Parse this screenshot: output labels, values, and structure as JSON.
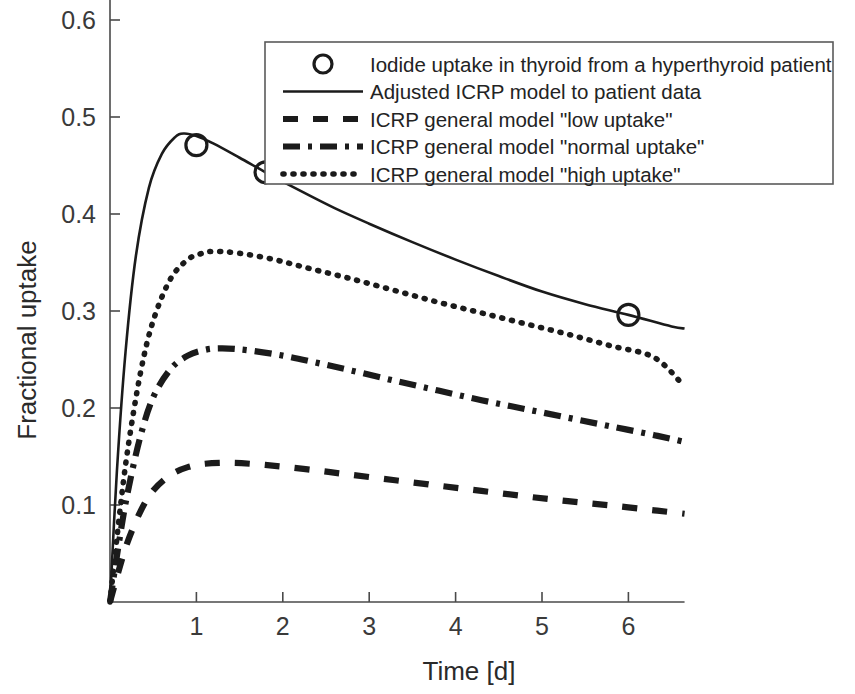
{
  "chart_data": {
    "type": "line",
    "title": "",
    "xlabel": "Time [d]",
    "ylabel": "Fractional uptake",
    "xlim": [
      0,
      6.65
    ],
    "ylim": [
      0,
      0.665
    ],
    "xticks": [
      1,
      2,
      3,
      4,
      5,
      6
    ],
    "xtick_labels": [
      "1",
      "2",
      "3",
      "4",
      "5",
      "6"
    ],
    "yticks": [
      0.1,
      0.2,
      0.3,
      0.4,
      0.5,
      0.6
    ],
    "ytick_labels": [
      "0.1",
      "0.2",
      "0.3",
      "0.4",
      "0.5",
      "0.6"
    ],
    "grid": false,
    "legend_position": "top-right",
    "series": [
      {
        "name": "Iodide uptake in thyroid from a hyperthyroid patient",
        "style": "marker",
        "marker": "circle-open",
        "x": [
          1.0,
          1.8,
          6.0
        ],
        "values": [
          0.471,
          0.443,
          0.296
        ]
      },
      {
        "name": "Adjusted ICRP model to patient data",
        "style": "solid",
        "x": [
          0.0,
          0.08,
          0.18,
          0.3,
          0.45,
          0.6,
          0.75,
          0.85,
          1.0,
          1.2,
          1.5,
          1.8,
          2.2,
          2.6,
          3.0,
          3.5,
          4.0,
          4.5,
          5.0,
          5.5,
          6.0,
          6.5,
          6.65
        ],
        "values": [
          0.0,
          0.135,
          0.258,
          0.357,
          0.427,
          0.462,
          0.479,
          0.483,
          0.4805,
          0.4725,
          0.458,
          0.443,
          0.424,
          0.406,
          0.39,
          0.371,
          0.353,
          0.336,
          0.32,
          0.307,
          0.296,
          0.284,
          0.282
        ]
      },
      {
        "name": "ICRP general model \"low uptake\"",
        "style": "dashed",
        "x": [
          0.0,
          0.1,
          0.2,
          0.35,
          0.5,
          0.7,
          0.9,
          1.1,
          1.4,
          1.7,
          2.0,
          2.4,
          2.8,
          3.3,
          3.8,
          4.3,
          4.8,
          5.3,
          5.8,
          6.3,
          6.65
        ],
        "values": [
          0.0,
          0.032,
          0.061,
          0.093,
          0.115,
          0.131,
          0.139,
          0.1425,
          0.1435,
          0.142,
          0.1395,
          0.1355,
          0.131,
          0.1255,
          0.12,
          0.1145,
          0.109,
          0.104,
          0.0995,
          0.0945,
          0.091
        ]
      },
      {
        "name": "ICRP general model \"normal uptake\"",
        "style": "dashdot",
        "x": [
          0.0,
          0.1,
          0.2,
          0.35,
          0.5,
          0.7,
          0.9,
          1.1,
          1.3,
          1.6,
          2.0,
          2.4,
          2.8,
          3.3,
          3.8,
          4.3,
          4.8,
          5.3,
          5.8,
          6.3,
          6.65
        ],
        "values": [
          0.0,
          0.059,
          0.111,
          0.17,
          0.211,
          0.24,
          0.254,
          0.26,
          0.2615,
          0.2595,
          0.254,
          0.2465,
          0.2385,
          0.228,
          0.218,
          0.208,
          0.199,
          0.19,
          0.181,
          0.172,
          0.165
        ]
      },
      {
        "name": "ICRP general model \"high uptake\"",
        "style": "dotted",
        "x": [
          0.0,
          0.1,
          0.2,
          0.35,
          0.5,
          0.7,
          0.9,
          1.05,
          1.2,
          1.5,
          1.9,
          2.3,
          2.8,
          3.3,
          3.8,
          4.3,
          4.8,
          5.3,
          5.8,
          6.3,
          6.65
        ],
        "values": [
          0.0,
          0.082,
          0.154,
          0.235,
          0.29,
          0.333,
          0.353,
          0.359,
          0.3615,
          0.3595,
          0.353,
          0.344,
          0.333,
          0.321,
          0.309,
          0.298,
          0.287,
          0.276,
          0.264,
          0.252,
          0.222
        ]
      }
    ]
  },
  "legend": {
    "entries": [
      {
        "label": "Iodide uptake in thyroid from a hyperthyroid patient",
        "style": "marker"
      },
      {
        "label": "Adjusted ICRP model to patient data",
        "style": "solid"
      },
      {
        "label": "ICRP general model \"low uptake\"",
        "style": "dashed"
      },
      {
        "label": "ICRP general model \"normal uptake\"",
        "style": "dashdot"
      },
      {
        "label": "ICRP general model \"high uptake\"",
        "style": "dotted"
      }
    ]
  },
  "colors": {
    "ink": "#1b1b1b",
    "axis": "#4a4a4a",
    "background": "#ffffff"
  }
}
